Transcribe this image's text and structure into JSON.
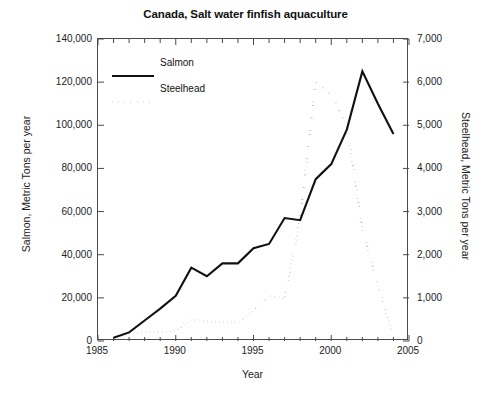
{
  "chart_data": {
    "type": "line",
    "title": "Canada, Salt water finfish aquaculture",
    "xlabel": "Year",
    "ylabel": "Salmon, Metric Tons per year",
    "ylabel_right": "Steelhead, Metric Tons per year",
    "xlim": [
      1985,
      2005
    ],
    "ylim": [
      0,
      140000
    ],
    "ylim_right": [
      0,
      7000
    ],
    "grid": false,
    "legend_position": "upper left",
    "x_ticks": [
      "1985",
      "1990",
      "1995",
      "2000",
      "2005"
    ],
    "x_tick_values": [
      1985,
      1990,
      1995,
      2000,
      2005
    ],
    "y_ticks_left": [
      "0",
      "20,000",
      "40,000",
      "60,000",
      "80,000",
      "100,000",
      "120,000",
      "140,000"
    ],
    "y_tick_values_left": [
      0,
      20000,
      40000,
      60000,
      80000,
      100000,
      120000,
      140000
    ],
    "y_ticks_right": [
      "0",
      "1,000",
      "2,000",
      "3,000",
      "4,000",
      "5,000",
      "6,000",
      "7,000"
    ],
    "y_tick_values_right": [
      0,
      1000,
      2000,
      3000,
      4000,
      5000,
      6000,
      7000
    ],
    "x": [
      1986,
      1987,
      1988,
      1989,
      1990,
      1991,
      1992,
      1993,
      1994,
      1995,
      1996,
      1997,
      1998,
      1999,
      2000,
      2001,
      2002,
      2003,
      2004
    ],
    "series": [
      {
        "name": "Salmon",
        "axis": "left",
        "style": "solid",
        "color": "#111111",
        "values": [
          1500,
          4000,
          9500,
          15000,
          21000,
          34000,
          30000,
          36000,
          36000,
          43000,
          45000,
          57000,
          56000,
          75000,
          82000,
          98000,
          125000,
          110000,
          96000
        ]
      },
      {
        "name": "Steelhead",
        "axis": "right",
        "style": "dotted",
        "color": "#111111",
        "values": [
          60,
          170,
          200,
          210,
          230,
          500,
          450,
          430,
          430,
          700,
          1050,
          980,
          2850,
          6000,
          5700,
          5000,
          2600,
          1300,
          100
        ]
      }
    ]
  },
  "legend": {
    "items": [
      {
        "label": "Salmon",
        "style": "solid"
      },
      {
        "label": "Steelhead",
        "style": "dotted"
      }
    ]
  },
  "caption": {
    "text": ""
  }
}
